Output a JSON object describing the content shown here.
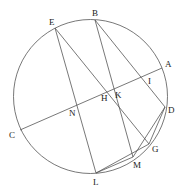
{
  "figure": {
    "type": "geometric-construction",
    "circle": {
      "cx": 90.5,
      "cy": 96.5,
      "r": 77
    },
    "points": {
      "A": {
        "x": 162,
        "y": 68,
        "label": "A",
        "lx": 165,
        "ly": 67
      },
      "B": {
        "x": 95,
        "y": 20,
        "label": "B",
        "lx": 92,
        "ly": 16
      },
      "C": {
        "x": 20,
        "y": 130,
        "label": "C",
        "lx": 9,
        "ly": 138
      },
      "D": {
        "x": 165,
        "y": 107,
        "label": "D",
        "lx": 168,
        "ly": 113
      },
      "E": {
        "x": 55,
        "y": 28,
        "label": "E",
        "lx": 49,
        "ly": 25
      },
      "G": {
        "x": 149,
        "y": 144,
        "label": "G",
        "lx": 152,
        "ly": 152
      },
      "H": {
        "x": 107,
        "y": 91,
        "label": "H",
        "lx": 101,
        "ly": 101
      },
      "I": {
        "x": 146,
        "y": 76,
        "label": "I",
        "lx": 148,
        "ly": 84
      },
      "K": {
        "x": 114,
        "y": 88,
        "label": "K",
        "lx": 115,
        "ly": 98
      },
      "L": {
        "x": 96,
        "y": 173,
        "label": "L",
        "lx": 93,
        "ly": 185
      },
      "M": {
        "x": 133,
        "y": 157,
        "label": "M",
        "lx": 133,
        "ly": 168
      },
      "N": {
        "x": 77,
        "y": 104,
        "label": "N",
        "lx": 69,
        "ly": 116
      }
    },
    "segments": [
      {
        "name": "chord-AC",
        "from": "A",
        "to": "C"
      },
      {
        "name": "line-EL",
        "from": "E",
        "to": "L"
      },
      {
        "name": "line-EG",
        "from": "E",
        "to": "G"
      },
      {
        "name": "line-BM",
        "from": "B",
        "to": "M"
      },
      {
        "name": "line-BD",
        "from": "B",
        "to": "D"
      },
      {
        "name": "line-LG",
        "from": "L",
        "to": "G"
      },
      {
        "name": "line-LM",
        "from": "L",
        "to": "M"
      },
      {
        "name": "line-MD",
        "from": "M",
        "to": "D"
      },
      {
        "name": "line-GD",
        "from": "G",
        "to": "D"
      }
    ]
  }
}
